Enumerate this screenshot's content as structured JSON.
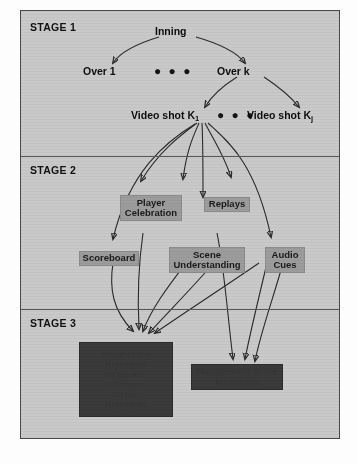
{
  "diagram": {
    "background_color": "#c9c9c9",
    "box_color": "#9c9c9c",
    "dark_box_color": "#3a3a3a",
    "stages": [
      {
        "id": "stage1",
        "label": "STAGE 1"
      },
      {
        "id": "stage2",
        "label": "STAGE 2"
      },
      {
        "id": "stage3",
        "label": "STAGE 3"
      }
    ],
    "stage1": {
      "root": "Inning",
      "over_first": "Over 1",
      "over_last": "Over k",
      "over_ellipsis": "● ● ●",
      "shot_first_main": "Video shot K",
      "shot_first_sub": "1",
      "shot_last_main": "Video shot K",
      "shot_last_sub": "j",
      "shot_ellipsis": "● ● ●"
    },
    "stage2": {
      "boxes": [
        {
          "id": "player-celebration",
          "label": "Player\nCelebration"
        },
        {
          "id": "replays",
          "label": "Replays"
        },
        {
          "id": "scoreboard",
          "label": "Scoreboard"
        },
        {
          "id": "scene-understanding",
          "label": "Scene\nUnderstanding"
        },
        {
          "id": "audio-cues",
          "label": "Audio\nCues"
        }
      ]
    },
    "stage3": {
      "boxes": [
        {
          "id": "event-detection",
          "lines": [
            "Event of the",
            "Highlights",
            "Of the key",
            "Changes",
            "Of the",
            "Highlights"
          ]
        },
        {
          "id": "highlight-management",
          "lines": [
            "Management of the",
            "Highlights"
          ]
        }
      ]
    }
  }
}
